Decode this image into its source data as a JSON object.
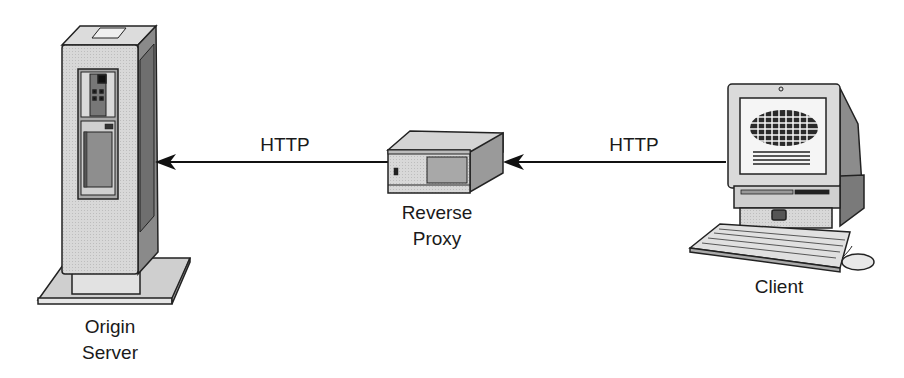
{
  "diagram": {
    "type": "network-flow",
    "nodes": [
      {
        "id": "origin",
        "label_line1": "Origin",
        "label_line2": "Server",
        "icon": "server-tower-icon"
      },
      {
        "id": "proxy",
        "label_line1": "Reverse",
        "label_line2": "Proxy",
        "icon": "proxy-box-icon"
      },
      {
        "id": "client",
        "label_line1": "Client",
        "icon": "desktop-computer-icon"
      }
    ],
    "edges": [
      {
        "from": "proxy",
        "to": "origin",
        "label": "HTTP"
      },
      {
        "from": "client",
        "to": "proxy",
        "label": "HTTP"
      }
    ]
  }
}
